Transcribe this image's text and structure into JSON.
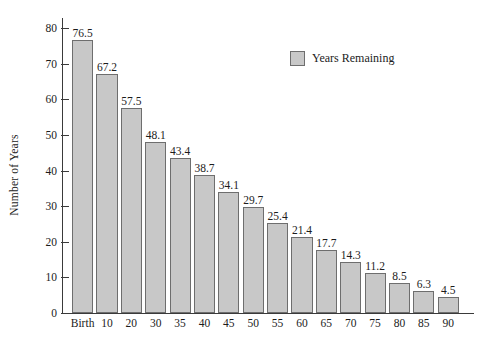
{
  "chart_data": {
    "type": "bar",
    "title": "",
    "xlabel": "",
    "ylabel": "Number of Years",
    "categories": [
      "Birth",
      "10",
      "20",
      "30",
      "35",
      "40",
      "45",
      "50",
      "55",
      "60",
      "65",
      "70",
      "75",
      "80",
      "85",
      "90"
    ],
    "values": [
      76.5,
      67.2,
      57.5,
      48.1,
      43.4,
      38.7,
      34.1,
      29.7,
      25.4,
      21.4,
      17.7,
      14.3,
      11.2,
      8.5,
      6.3,
      4.5
    ],
    "value_labels": [
      "76.5",
      "67.2",
      "57.5",
      "48.1",
      "43.4",
      "38.7",
      "34.1",
      "29.7",
      "25.4",
      "21.4",
      "17.7",
      "14.3",
      "11.2",
      "8.5",
      "6.3",
      "4.5"
    ],
    "series": [
      {
        "name": "Years Remaining",
        "values": [
          76.5,
          67.2,
          57.5,
          48.1,
          43.4,
          38.7,
          34.1,
          29.7,
          25.4,
          21.4,
          17.7,
          14.3,
          11.2,
          8.5,
          6.3,
          4.5
        ]
      }
    ],
    "ylim": [
      0,
      80
    ],
    "yticks": [
      0,
      10,
      20,
      30,
      40,
      50,
      60,
      70,
      80
    ],
    "ytick_labels": [
      "0",
      "10",
      "20",
      "30",
      "40",
      "50",
      "60",
      "70",
      "80"
    ],
    "grid": false,
    "legend": {
      "position": "top-right",
      "entries": [
        {
          "label": "Years Remaining",
          "color": "#c8c8c8"
        }
      ]
    },
    "colors": {
      "bar_fill": "#c8c8c8",
      "bar_border": "#6e6e6e",
      "axis": "#3a3a3a",
      "text": "#1c1c1c",
      "background": "#ffffff"
    }
  }
}
